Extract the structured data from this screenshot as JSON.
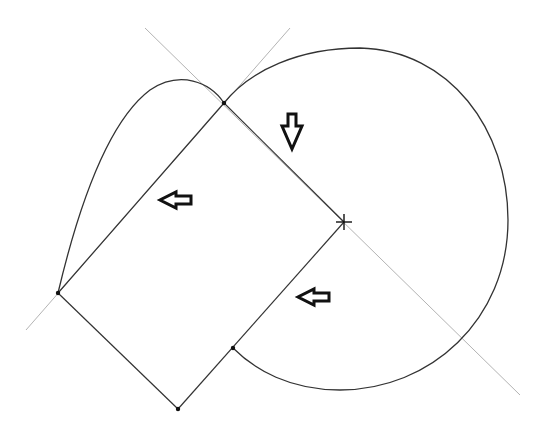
{
  "diagram": {
    "width": 548,
    "height": 438,
    "background": "#ffffff",
    "stroke_color": "#333333",
    "construction_color": "#999999",
    "points": {
      "top_vertex": [
        224,
        103
      ],
      "center_cross": [
        344,
        222
      ],
      "left_vertex": [
        58,
        293
      ],
      "bottom_vertex": [
        178,
        409
      ],
      "inner_point": [
        233,
        348
      ]
    },
    "arrows": [
      {
        "name": "arrow-down",
        "direction": "down",
        "position": [
          292,
          131
        ]
      },
      {
        "name": "arrow-left-upper",
        "direction": "left",
        "position": [
          176,
          200
        ]
      },
      {
        "name": "arrow-left-lower",
        "direction": "left",
        "position": [
          314,
          297
        ]
      }
    ]
  }
}
